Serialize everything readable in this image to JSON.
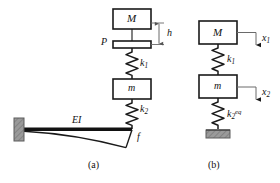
{
  "figure": {
    "background": "#ffffff",
    "line_color": "#1a1a1a",
    "hatch_color": "#8c8c8c",
    "width": 280,
    "height": 183
  },
  "panel_a": {
    "caption": "(a)",
    "labels": {
      "mass_upper": "M",
      "plate": "P",
      "spring_upper": "k",
      "spring_upper_sub": "1",
      "mass_lower": "m",
      "spring_lower": "k",
      "spring_lower_sub": "2",
      "beam_rigidity": "EI",
      "tip_force": "f",
      "gap_dimension": "h"
    },
    "elements": [
      {
        "name": "mass-M-block",
        "type": "rect",
        "label": "M"
      },
      {
        "name": "plate-P",
        "type": "thin-rect",
        "label": "P"
      },
      {
        "name": "spring-k1",
        "type": "zigzag-spring",
        "label": "k1"
      },
      {
        "name": "mass-m-block",
        "type": "rect",
        "label": "m"
      },
      {
        "name": "spring-k2",
        "type": "zigzag-spring",
        "label": "k2"
      },
      {
        "name": "cantilever-beam",
        "type": "beam",
        "label": "EI"
      },
      {
        "name": "fixed-support",
        "type": "hatched-wall"
      },
      {
        "name": "deflection-curve",
        "type": "curve"
      },
      {
        "name": "gap-dimension-h",
        "type": "dimension-line",
        "label": "h"
      }
    ]
  },
  "panel_b": {
    "caption": "(b)",
    "labels": {
      "mass_upper": "M",
      "spring_upper": "k",
      "spring_upper_sub": "1",
      "mass_lower": "m",
      "spring_equivalent": "k",
      "spring_equivalent_sub": "2",
      "spring_equivalent_sup": "eq",
      "disp_upper": "x",
      "disp_upper_sub": "1",
      "disp_lower": "x",
      "disp_lower_sub": "2"
    },
    "elements": [
      {
        "name": "mass-M-block",
        "type": "rect",
        "label": "M"
      },
      {
        "name": "spring-k1",
        "type": "zigzag-spring",
        "label": "k1"
      },
      {
        "name": "mass-m-block",
        "type": "rect",
        "label": "m"
      },
      {
        "name": "spring-k2eq",
        "type": "zigzag-spring",
        "label": "k2eq"
      },
      {
        "name": "ground-support",
        "type": "hatched-ground"
      },
      {
        "name": "displacement-arrow-x1",
        "type": "arrow-down",
        "label": "x1"
      },
      {
        "name": "displacement-arrow-x2",
        "type": "arrow-down",
        "label": "x2"
      }
    ]
  }
}
